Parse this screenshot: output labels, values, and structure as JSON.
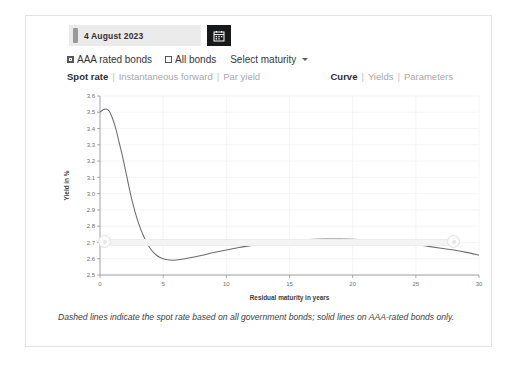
{
  "datepicker": {
    "value": "4 August 2023",
    "calendar_icon": "calendar-icon"
  },
  "options": {
    "aaa_label": "AAA rated bonds",
    "aaa_checked": true,
    "all_label": "All bonds",
    "all_checked": false,
    "maturity_select": "Select maturity"
  },
  "tabs": {
    "left": [
      {
        "label": "Spot rate",
        "active": true
      },
      {
        "label": "Instantaneous forward",
        "active": false
      },
      {
        "label": "Par yield",
        "active": false
      }
    ],
    "right": [
      {
        "label": "Curve",
        "active": true
      },
      {
        "label": "Yields",
        "active": false
      },
      {
        "label": "Parameters",
        "active": false
      }
    ],
    "separator": "|"
  },
  "caption": "Dashed lines indicate the spot rate based on all government bonds; solid lines on AAA-rated bonds only.",
  "slider": {
    "left_handle": "range-handle-left",
    "right_handle": "range-handle-right"
  },
  "chart_data": {
    "type": "line",
    "title": "",
    "xlabel": "Residual maturity in years",
    "ylabel": "Yield in %",
    "xlim": [
      0,
      30
    ],
    "ylim": [
      2.5,
      3.6
    ],
    "xticks": [
      0,
      5,
      10,
      15,
      20,
      25,
      30
    ],
    "xtick_labels": [
      "0",
      "5",
      "10",
      "15",
      "20",
      "25",
      "30"
    ],
    "yticks": [
      2.5,
      2.6,
      2.7,
      2.8,
      2.9,
      3.0,
      3.1,
      3.2,
      3.3,
      3.4,
      3.5,
      3.6
    ],
    "ytick_labels": [
      "2.5",
      "2.6",
      "2.7",
      "2.8",
      "2.9",
      "3.0",
      "3.1",
      "3.2",
      "3.3",
      "3.4",
      "3.5",
      "3.6"
    ],
    "grid": true,
    "legend": "none",
    "line_style": "solid",
    "line_color": "#6b6c70",
    "series": [
      {
        "name": "AAA rated bonds spot rate",
        "x": [
          0.0,
          0.25,
          0.5,
          0.75,
          1.0,
          1.25,
          1.5,
          1.75,
          2.0,
          2.5,
          3.0,
          3.5,
          4.0,
          4.5,
          5.0,
          5.5,
          6.0,
          6.5,
          7.0,
          8.0,
          9.0,
          10.0,
          11.0,
          12.0,
          13.0,
          14.0,
          15.0,
          16.0,
          17.0,
          18.0,
          19.0,
          20.0,
          21.0,
          22.0,
          23.0,
          24.0,
          25.0,
          26.0,
          27.0,
          28.0,
          29.0,
          30.0
        ],
        "y": [
          3.5,
          3.515,
          3.52,
          3.505,
          3.46,
          3.4,
          3.32,
          3.24,
          3.15,
          2.97,
          2.83,
          2.73,
          2.66,
          2.62,
          2.6,
          2.592,
          2.592,
          2.597,
          2.604,
          2.62,
          2.638,
          2.654,
          2.669,
          2.682,
          2.694,
          2.703,
          2.71,
          2.715,
          2.719,
          2.721,
          2.721,
          2.719,
          2.715,
          2.71,
          2.703,
          2.695,
          2.686,
          2.676,
          2.665,
          2.653,
          2.639,
          2.622
        ]
      }
    ]
  }
}
